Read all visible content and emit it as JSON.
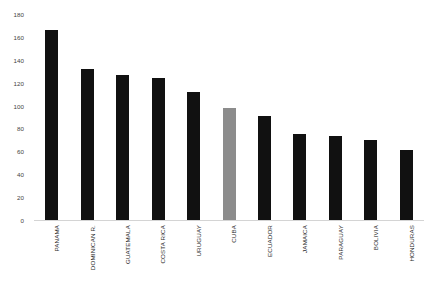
{
  "chart_data": {
    "type": "bar",
    "title": "",
    "subtitle": "",
    "xlabel": "",
    "ylabel": "",
    "ylim": [
      0,
      180
    ],
    "grid": false,
    "legend": "none",
    "categories": [
      "PANAMA",
      "DOMINICAN R.",
      "GUATEMALA",
      "COSTA RICA",
      "URUGUAY",
      "CUBA",
      "ECUADOR",
      "JAMAICA",
      "PARAGUAY",
      "BOLIVIA",
      "HONDURAS"
    ],
    "values": [
      167,
      133,
      128,
      125,
      113,
      99,
      92,
      76,
      74,
      71,
      62
    ],
    "bar_colors": [
      "#111111",
      "#111111",
      "#111111",
      "#111111",
      "#111111",
      "#8c8c8c",
      "#111111",
      "#111111",
      "#111111",
      "#111111",
      "#111111"
    ],
    "highlighted_category": "CUBA",
    "y_ticks": [
      0,
      20,
      40,
      60,
      80,
      100,
      120,
      140,
      160,
      180
    ],
    "y_tick_labels": [
      "0",
      "20",
      "40",
      "60",
      "80",
      "100",
      "120",
      "140",
      "160",
      "180"
    ]
  },
  "colors": {
    "bar_default": "#111111",
    "bar_highlight": "#8c8c8c",
    "axis_line": "#d4d4d4",
    "tick_text": "#3f3f3f",
    "category_text": "#2a2a2a",
    "background": "#ffffff"
  }
}
